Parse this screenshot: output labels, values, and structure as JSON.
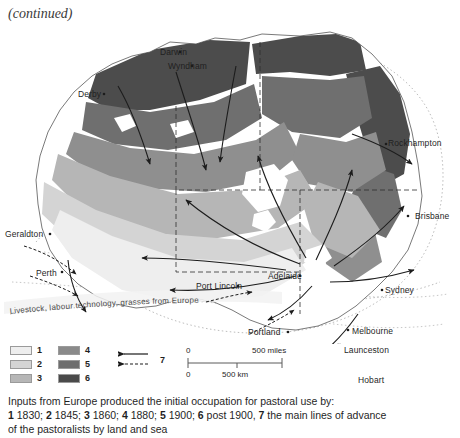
{
  "header": {
    "continued_note": "(continued)"
  },
  "map": {
    "banner_text": "Livestock, labour technology, grasses from Europe",
    "cities": [
      {
        "name": "Darwin",
        "x": 160,
        "y": 47
      },
      {
        "name": "Wyndham",
        "x": 168,
        "y": 61
      },
      {
        "name": "Derby",
        "x": 78,
        "y": 89
      },
      {
        "name": "Geraldton",
        "x": 5,
        "y": 229
      },
      {
        "name": "Perth",
        "x": 36,
        "y": 268
      },
      {
        "name": "Port Lincoln",
        "x": 196,
        "y": 281
      },
      {
        "name": "Adelaide",
        "x": 268,
        "y": 271
      },
      {
        "name": "Portland",
        "x": 248,
        "y": 327
      },
      {
        "name": "Rockhampton",
        "x": 388,
        "y": 138
      },
      {
        "name": "Brisbane",
        "x": 415,
        "y": 211
      },
      {
        "name": "Sydney",
        "x": 385,
        "y": 285
      },
      {
        "name": "Melbourne",
        "x": 352,
        "y": 326
      },
      {
        "name": "Launceston",
        "x": 344,
        "y": 345
      },
      {
        "name": "Hobart",
        "x": 358,
        "y": 375
      }
    ],
    "colors": {
      "zone1": "#e8e8e8",
      "zone2": "#d2d2d2",
      "zone3": "#b4b4b4",
      "zone4": "#8f8f8f",
      "zone5": "#6f6f6f",
      "zone6": "#4c4c4c",
      "land_outline": "#6a6a6a",
      "sea_route": "#a8a8a8",
      "arrow": "#1c1c1c",
      "background": "#ffffff"
    }
  },
  "legend": {
    "swatches": [
      {
        "id": "1",
        "color": "#eeeeee"
      },
      {
        "id": "2",
        "color": "#d4d4d4"
      },
      {
        "id": "3",
        "color": "#b6b6b6"
      },
      {
        "id": "4",
        "color": "#8a8a8a"
      },
      {
        "id": "5",
        "color": "#6e6e6e"
      },
      {
        "id": "6",
        "color": "#4a4a4a"
      }
    ],
    "arrow_key_label": "7"
  },
  "scale": {
    "miles_zero": "0",
    "miles_max": "500 miles",
    "km_zero": "0",
    "km_max": "500 km"
  },
  "caption": {
    "line1": "Inputs from Europe produced the initial occupation for pastoral use by:",
    "line2_parts": [
      {
        "bold": "1",
        "text": " 1830; "
      },
      {
        "bold": "2",
        "text": " 1845; "
      },
      {
        "bold": "3",
        "text": " 1860; "
      },
      {
        "bold": "4",
        "text": " 1880; "
      },
      {
        "bold": "5",
        "text": " 1900; "
      },
      {
        "bold": "6",
        "text": " post 1900, "
      },
      {
        "bold": "7",
        "text": " the main lines of advance"
      }
    ],
    "line3": "of the pastoralists by land and sea"
  }
}
